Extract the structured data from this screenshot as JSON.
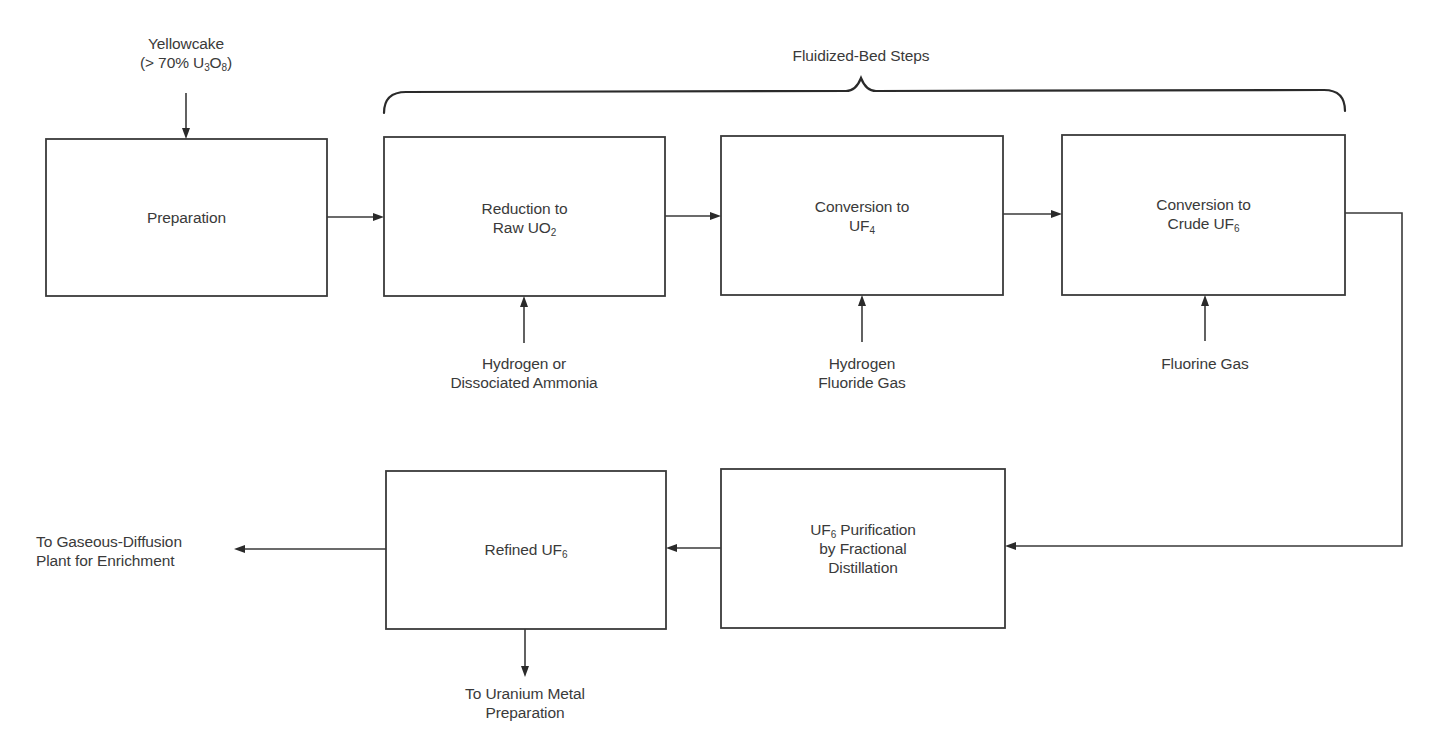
{
  "diagram": {
    "bracket_label": "Fluidized-Bed Steps",
    "feed": {
      "line1": "Yellowcake",
      "line2_prefix": "(> 70% U",
      "line2_sub1": "3",
      "line2_mid": "O",
      "line2_sub2": "8",
      "line2_suffix": ")"
    },
    "boxes": [
      {
        "id": "preparation",
        "line1": "Preparation"
      },
      {
        "id": "reduction",
        "line1": "Reduction to",
        "line2_prefix": "Raw UO",
        "line2_sub": "2"
      },
      {
        "id": "conversion-uf4",
        "line1": "Conversion to",
        "line2_prefix": "UF",
        "line2_sub": "4"
      },
      {
        "id": "conversion-crude-uf6",
        "line1": "Conversion to",
        "line2_prefix": "Crude UF",
        "line2_sub": "6"
      },
      {
        "id": "purification",
        "line1_prefix": "UF",
        "line1_sub": "6",
        "line1_suffix": " Purification",
        "line2": "by Fractional",
        "line3": "Distillation"
      },
      {
        "id": "refined-uf6",
        "line1_prefix": "Refined UF",
        "line1_sub": "6"
      }
    ],
    "inputs": [
      {
        "id": "hydrogen-ammonia",
        "line1": "Hydrogen or",
        "line2": "Dissociated Ammonia"
      },
      {
        "id": "hydrogen-fluoride",
        "line1": "Hydrogen",
        "line2": "Fluoride Gas"
      },
      {
        "id": "fluorine",
        "line1": "Fluorine Gas"
      }
    ],
    "outputs": [
      {
        "id": "gaseous-diffusion",
        "line1": "To Gaseous-Diffusion",
        "line2": "Plant for Enrichment"
      },
      {
        "id": "uranium-metal",
        "line1": "To Uranium Metal",
        "line2": "Preparation"
      }
    ],
    "colors": {
      "stroke": "#3a3a3a",
      "text": "#3a3a3a",
      "background": "#ffffff"
    }
  }
}
